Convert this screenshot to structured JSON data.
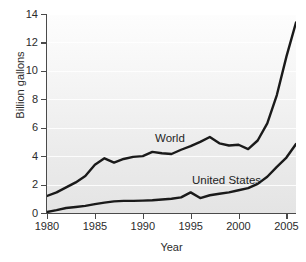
{
  "chart_data": {
    "type": "line",
    "title": "",
    "xlabel": "Year",
    "ylabel": "Billion gallons",
    "xlim": [
      1980,
      2006
    ],
    "ylim": [
      0,
      14
    ],
    "grid": true,
    "legend_position": "inline-annotations",
    "xticks": [
      1980,
      1985,
      1990,
      1995,
      2000,
      2005
    ],
    "xtick_labels": [
      "1980",
      "1985",
      "1990",
      "1995",
      "2000",
      "2005"
    ],
    "yticks": [
      0,
      2,
      4,
      6,
      8,
      10,
      12,
      14
    ],
    "ytick_labels": [
      "0",
      "2",
      "4",
      "6",
      "8",
      "10",
      "12",
      "14"
    ],
    "x": [
      1980,
      1981,
      1982,
      1983,
      1984,
      1985,
      1986,
      1987,
      1988,
      1989,
      1990,
      1991,
      1992,
      1993,
      1994,
      1995,
      1996,
      1997,
      1998,
      1999,
      2000,
      2001,
      2002,
      2003,
      2004,
      2005,
      2006
    ],
    "series": [
      {
        "name": "World",
        "color": "#1a1a1a",
        "values": [
          1.2,
          1.45,
          1.8,
          2.15,
          2.6,
          3.4,
          3.85,
          3.55,
          3.8,
          3.95,
          4.0,
          4.3,
          4.2,
          4.15,
          4.45,
          4.7,
          5.0,
          5.35,
          4.9,
          4.75,
          4.8,
          4.5,
          5.1,
          6.3,
          8.3,
          11.0,
          13.4
        ]
      },
      {
        "name": "United States",
        "color": "#1a1a1a",
        "values": [
          0.07,
          0.2,
          0.35,
          0.42,
          0.5,
          0.62,
          0.73,
          0.82,
          0.85,
          0.85,
          0.87,
          0.9,
          0.95,
          1.0,
          1.1,
          1.45,
          1.05,
          1.25,
          1.35,
          1.45,
          1.6,
          1.75,
          2.05,
          2.55,
          3.25,
          3.9,
          4.85
        ]
      }
    ],
    "annotations": [
      {
        "text": "World",
        "x": 1993,
        "y": 5.6
      },
      {
        "text": "United States",
        "x": 1997.5,
        "y": 2.9
      }
    ]
  },
  "axes": {
    "x_title": "Year",
    "y_title": "Billion gallons"
  }
}
